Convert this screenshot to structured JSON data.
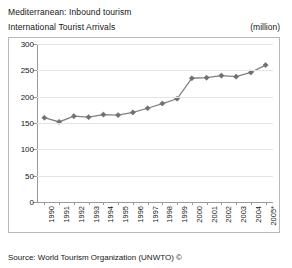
{
  "header": {
    "title_primary": "Mediterranean: Inbound tourism",
    "title_secondary": "International Tourist Arrivals",
    "units": "(million)"
  },
  "footer": {
    "source": "Source: World Tourism Organization (UNWTO) ©"
  },
  "colors": {
    "series": "#808080",
    "marker": "#707070",
    "grid": "#e4e4e4",
    "axis": "#9a9a9a",
    "frame": "#b9b9b9",
    "text": "#151515",
    "background": "#ffffff"
  },
  "chart_data": {
    "type": "line",
    "subtitle": "International Tourist Arrivals",
    "xlabel": "",
    "ylabel": "(million)",
    "units": "million",
    "grid": true,
    "legend": false,
    "legend_position": "none",
    "ylim": [
      0,
      300
    ],
    "yticks": [
      0,
      50,
      100,
      150,
      200,
      250,
      300
    ],
    "ytick_labels": [
      "0",
      "50",
      "100",
      "150",
      "200",
      "250",
      "300"
    ],
    "categories": [
      "1990",
      "1991",
      "1992",
      "1993",
      "1994",
      "1995",
      "1996",
      "1997",
      "1998",
      "1999",
      "2000",
      "2001",
      "2002",
      "2003",
      "2004",
      "2005*"
    ],
    "x": [
      1990,
      1991,
      1992,
      1993,
      1994,
      1995,
      1996,
      1997,
      1998,
      1999,
      2000,
      2001,
      2002,
      2003,
      2004,
      2005
    ],
    "values": [
      160,
      152,
      163,
      161,
      166,
      165,
      170,
      178,
      187,
      196,
      235,
      236,
      240,
      238,
      246,
      260
    ],
    "marker": "diamond",
    "annotations": [
      "2005* denotes provisional data"
    ]
  }
}
